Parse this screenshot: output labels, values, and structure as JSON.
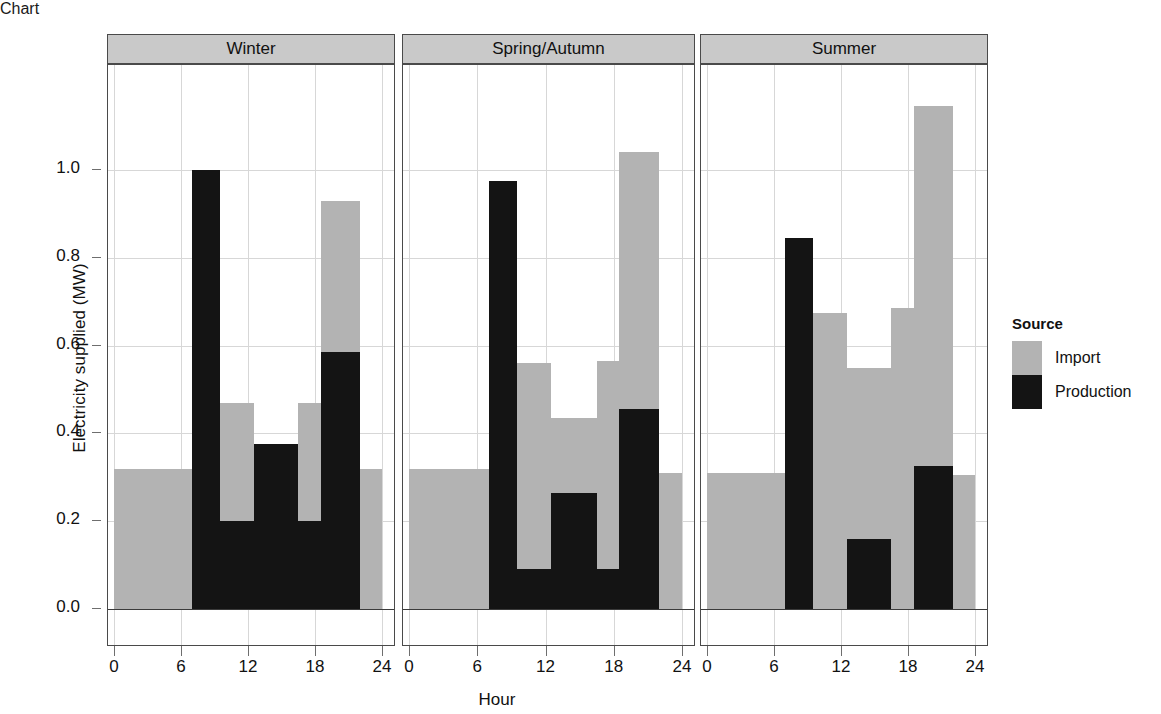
{
  "chart_data": {
    "type": "bar",
    "title": "",
    "subtitle": "",
    "xlabel": "Hour",
    "ylabel": "Electricity supplied (MW)",
    "stacked": true,
    "orientation": "vertical",
    "grid": true,
    "xlim": [
      0,
      24
    ],
    "ylim": [
      0.0,
      1.19
    ],
    "x_ticks": [
      0,
      6,
      12,
      18,
      24
    ],
    "x_tick_labels": [
      "0",
      "6",
      "12",
      "18",
      "24"
    ],
    "y_ticks": [
      0.0,
      0.2,
      0.4,
      0.6,
      0.8,
      1.0
    ],
    "y_tick_labels": [
      "0.0",
      "0.2",
      "0.4",
      "0.6",
      "0.8",
      "1.0"
    ],
    "legend_title": "Source",
    "legend_position": "right",
    "series": [
      {
        "name": "Import",
        "color": "#b3b3b3"
      },
      {
        "name": "Production",
        "color": "#141414"
      }
    ],
    "facet_variable": "Season",
    "facets": [
      {
        "label": "Winter",
        "bins": [
          {
            "hour_start": 0.0,
            "hour_end": 7.0,
            "production": 0.0,
            "import": 0.32,
            "total": 0.32
          },
          {
            "hour_start": 7.0,
            "hour_end": 9.5,
            "production": 1.0,
            "import": 0.0,
            "total": 1.0
          },
          {
            "hour_start": 9.5,
            "hour_end": 12.5,
            "production": 0.2,
            "import": 0.27,
            "total": 0.47
          },
          {
            "hour_start": 12.5,
            "hour_end": 16.5,
            "production": 0.375,
            "import": 0.0,
            "total": 0.375
          },
          {
            "hour_start": 16.5,
            "hour_end": 18.5,
            "production": 0.2,
            "import": 0.27,
            "total": 0.47
          },
          {
            "hour_start": 18.5,
            "hour_end": 22.0,
            "production": 0.585,
            "import": 0.345,
            "total": 0.93
          },
          {
            "hour_start": 22.0,
            "hour_end": 24.0,
            "production": 0.0,
            "import": 0.32,
            "total": 0.32
          }
        ]
      },
      {
        "label": "Spring/Autumn",
        "bins": [
          {
            "hour_start": 0.0,
            "hour_end": 7.0,
            "production": 0.0,
            "import": 0.32,
            "total": 0.32
          },
          {
            "hour_start": 7.0,
            "hour_end": 9.5,
            "production": 0.975,
            "import": 0.0,
            "total": 0.975
          },
          {
            "hour_start": 9.5,
            "hour_end": 12.5,
            "production": 0.09,
            "import": 0.47,
            "total": 0.56
          },
          {
            "hour_start": 12.5,
            "hour_end": 16.5,
            "production": 0.265,
            "import": 0.17,
            "total": 0.435
          },
          {
            "hour_start": 16.5,
            "hour_end": 18.5,
            "production": 0.09,
            "import": 0.475,
            "total": 0.565
          },
          {
            "hour_start": 18.5,
            "hour_end": 22.0,
            "production": 0.455,
            "import": 0.585,
            "total": 1.04
          },
          {
            "hour_start": 22.0,
            "hour_end": 24.0,
            "production": 0.0,
            "import": 0.31,
            "total": 0.31
          }
        ]
      },
      {
        "label": "Summer",
        "bins": [
          {
            "hour_start": 0.0,
            "hour_end": 7.0,
            "production": 0.0,
            "import": 0.31,
            "total": 0.31
          },
          {
            "hour_start": 7.0,
            "hour_end": 9.5,
            "production": 0.845,
            "import": 0.0,
            "total": 0.845
          },
          {
            "hour_start": 9.5,
            "hour_end": 12.5,
            "production": 0.0,
            "import": 0.675,
            "total": 0.675
          },
          {
            "hour_start": 12.5,
            "hour_end": 16.5,
            "production": 0.16,
            "import": 0.39,
            "total": 0.55
          },
          {
            "hour_start": 16.5,
            "hour_end": 18.5,
            "production": 0.0,
            "import": 0.685,
            "total": 0.685
          },
          {
            "hour_start": 18.5,
            "hour_end": 22.0,
            "production": 0.325,
            "import": 0.82,
            "total": 1.145
          },
          {
            "hour_start": 22.0,
            "hour_end": 24.0,
            "production": 0.0,
            "import": 0.305,
            "total": 0.305
          }
        ]
      }
    ]
  },
  "legend": {
    "title": "Source",
    "items": [
      {
        "label": "Import",
        "color": "#b3b3b3"
      },
      {
        "label": "Production",
        "color": "#141414"
      }
    ]
  },
  "axes": {
    "y_title": "Electricity supplied (MW)",
    "x_title": "Hour"
  }
}
